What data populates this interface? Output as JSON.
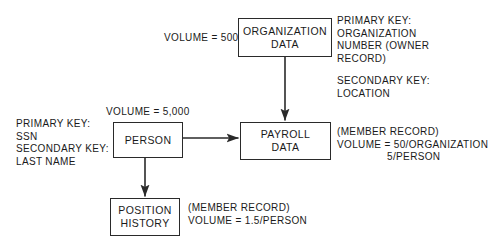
{
  "diagram": {
    "stroke_color": "#2a2a2a",
    "background_color": "#ffffff",
    "nodes": [
      {
        "id": "organization-data",
        "line1": "ORGANIZATION",
        "line2": "DATA"
      },
      {
        "id": "person",
        "line1": "PERSON",
        "line2": ""
      },
      {
        "id": "payroll-data",
        "line1": "PAYROLL",
        "line2": "DATA"
      },
      {
        "id": "position-history",
        "line1": "POSITION",
        "line2": "HISTORY"
      }
    ],
    "annotations": {
      "organization_volume": "VOLUME = 500",
      "person_volume": "VOLUME = 5,000",
      "person_keys": "PRIMARY KEY:\nSSN\nSECONDARY KEY:\nLAST NAME",
      "organization_primary_key": "PRIMARY KEY:\nORGANIZATION\nNUMBER (OWNER\nRECORD)",
      "organization_secondary_key": "SECONDARY KEY:\nLOCATION",
      "payroll_note": "(MEMBER RECORD)\nVOLUME = 50/ORGANIZATION\n                5/PERSON",
      "position_history_note": "(MEMBER RECORD)\nVOLUME = 1.5/PERSON"
    },
    "edges": [
      {
        "id": "organization-to-payroll",
        "from": "organization-data",
        "to": "payroll-data",
        "direction": "down"
      },
      {
        "id": "person-to-payroll",
        "from": "person",
        "to": "payroll-data",
        "direction": "right"
      },
      {
        "id": "person-to-position-history",
        "from": "person",
        "to": "position-history",
        "direction": "down"
      }
    ]
  }
}
